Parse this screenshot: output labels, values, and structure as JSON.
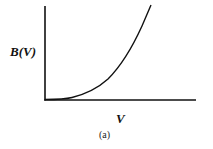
{
  "figure": {
    "caption": "(a)",
    "y_axis_label": "B(V)",
    "x_axis_label": "V"
  },
  "colors": {
    "line": "#111111",
    "background": "#ffffff"
  }
}
